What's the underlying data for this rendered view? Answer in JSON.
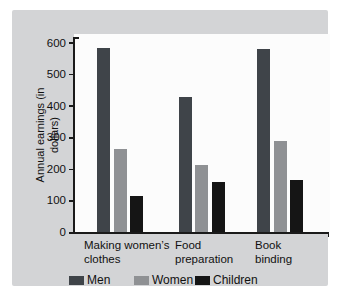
{
  "figure": {
    "panel_color": "#d3d4d6",
    "plot_background": "#fcfcfc",
    "axis_color": "#1a1a1a",
    "text_color": "#111111"
  },
  "chart_data": {
    "type": "bar",
    "title": "",
    "xlabel": "",
    "ylabel": "Annual earnings (in dollars)",
    "ylim": [
      0,
      600
    ],
    "yticks": [
      0,
      100,
      200,
      300,
      400,
      500,
      600
    ],
    "grid": false,
    "legend_position": "bottom",
    "categories": [
      {
        "label": "Making women’s clothes",
        "lines": [
          "Making women’s",
          "clothes"
        ]
      },
      {
        "label": "Food preparation",
        "lines": [
          "Food",
          "preparation"
        ]
      },
      {
        "label": "Book binding",
        "lines": [
          "Book",
          "binding"
        ]
      }
    ],
    "series": [
      {
        "name": "Men",
        "color": "#3f4449",
        "values": [
          585,
          430,
          580
        ]
      },
      {
        "name": "Women",
        "color": "#8f9194",
        "values": [
          265,
          215,
          290
        ]
      },
      {
        "name": "Children",
        "color": "#151515",
        "values": [
          115,
          160,
          165
        ]
      }
    ]
  }
}
